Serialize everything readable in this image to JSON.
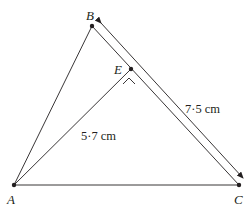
{
  "diagram": {
    "type": "geometry-triangle",
    "points": {
      "A": {
        "label": "A",
        "x": 14,
        "y": 185
      },
      "B": {
        "label": "B",
        "x": 92,
        "y": 26
      },
      "C": {
        "label": "C",
        "x": 239,
        "y": 185
      },
      "E": {
        "label": "E",
        "x": 131,
        "y": 69
      }
    },
    "segments": [
      {
        "from": "A",
        "to": "B"
      },
      {
        "from": "B",
        "to": "C"
      },
      {
        "from": "A",
        "to": "C"
      },
      {
        "from": "A",
        "to": "E"
      }
    ],
    "measurements": {
      "BC": "7·5 cm",
      "AE": "5·7 cm"
    },
    "angle_mark": {
      "at": "E",
      "description": "right-angle caret between AE and EC"
    },
    "colors": {
      "line": "#231f20",
      "background": "#ffffff"
    }
  }
}
